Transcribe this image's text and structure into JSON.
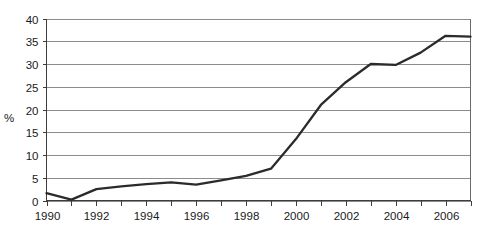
{
  "chart_data": {
    "type": "line",
    "title": "",
    "xlabel": "",
    "ylabel": "%",
    "xlim": [
      1990,
      2007
    ],
    "ylim": [
      0,
      40
    ],
    "ytick_step": 5,
    "yticks": [
      0,
      5,
      10,
      15,
      20,
      25,
      30,
      35,
      40
    ],
    "ytick_labels": [
      "0",
      "5",
      "10",
      "15",
      "20",
      "25",
      "30",
      "35",
      "40"
    ],
    "xticks": [
      1990,
      1991,
      1992,
      1993,
      1994,
      1995,
      1996,
      1997,
      1998,
      1999,
      2000,
      2001,
      2002,
      2003,
      2004,
      2005,
      2006,
      2007
    ],
    "xtick_labels_shown": [
      "1990",
      "1992",
      "1994",
      "1996",
      "1998",
      "2000",
      "2002",
      "2004",
      "2006"
    ],
    "xtick_label_step": 2,
    "grid": true,
    "grid_axis": "y",
    "legend": false,
    "legend_position": "none",
    "x": [
      1990,
      1991,
      1992,
      1993,
      1994,
      1995,
      1996,
      1997,
      1998,
      1999,
      2000,
      2001,
      2002,
      2003,
      2004,
      2005,
      2006,
      2007
    ],
    "values": [
      1.6,
      0.2,
      2.5,
      3.1,
      3.6,
      4.0,
      3.5,
      4.4,
      5.4,
      7.0,
      13.5,
      21.0,
      26.0,
      30.0,
      29.8,
      32.5,
      36.2,
      36.0
    ],
    "series": [
      {
        "name": "series-1",
        "color": "#2b2b2b",
        "values": [
          1.6,
          0.2,
          2.5,
          3.1,
          3.6,
          4.0,
          3.5,
          4.4,
          5.4,
          7.0,
          13.5,
          21.0,
          26.0,
          30.0,
          29.8,
          32.5,
          36.2,
          36.0
        ]
      }
    ],
    "colors": {
      "line": "#2b2b2b",
      "grid": "#8c8c8c",
      "axis": "#3d3d3d",
      "frame": "#6b6b6b",
      "background": "#ffffff",
      "text": "#1a1a1a"
    }
  }
}
